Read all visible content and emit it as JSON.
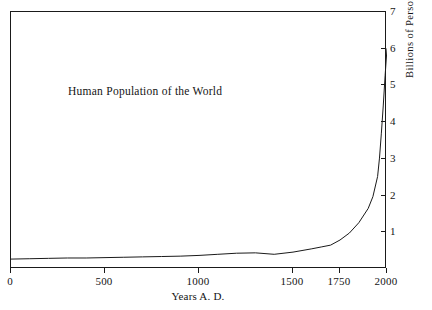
{
  "chart_data": {
    "type": "line",
    "title": "Human Population of the World",
    "xlabel": "Years A. D.",
    "ylabel": "Billions of Persons",
    "xlim": [
      0,
      2000
    ],
    "ylim": [
      0,
      7
    ],
    "grid": false,
    "legend": "none",
    "x_ticks": [
      {
        "value": 0,
        "label": "0"
      },
      {
        "value": 500,
        "label": "500"
      },
      {
        "value": 1000,
        "label": "1000"
      },
      {
        "value": 1500,
        "label": "1500"
      },
      {
        "value": 1750,
        "label": "1750"
      },
      {
        "value": 2000,
        "label": "2000"
      }
    ],
    "y_ticks": [
      {
        "value": 1,
        "label": "1"
      },
      {
        "value": 2,
        "label": "2"
      },
      {
        "value": 3,
        "label": "3"
      },
      {
        "value": 4,
        "label": "4"
      },
      {
        "value": 5,
        "label": "5"
      },
      {
        "value": 6,
        "label": "6"
      },
      {
        "value": 7,
        "label": "7"
      }
    ],
    "series": [
      {
        "name": "World population",
        "color": "#1a1a1a",
        "x": [
          0,
          100,
          200,
          300,
          400,
          500,
          600,
          700,
          800,
          900,
          1000,
          1100,
          1200,
          1300,
          1400,
          1500,
          1600,
          1650,
          1700,
          1750,
          1800,
          1850,
          1900,
          1925,
          1950,
          1960,
          1970,
          1980,
          1990,
          2000
        ],
        "y": [
          0.27,
          0.28,
          0.29,
          0.3,
          0.3,
          0.31,
          0.32,
          0.33,
          0.34,
          0.35,
          0.37,
          0.4,
          0.43,
          0.44,
          0.4,
          0.46,
          0.55,
          0.6,
          0.65,
          0.79,
          0.98,
          1.26,
          1.65,
          1.97,
          2.52,
          3.02,
          3.7,
          4.44,
          5.27,
          6.0
        ]
      }
    ]
  },
  "title_text": "Human Population of the World",
  "axis": {
    "x_title": "Years A. D.",
    "y_title": "Billions of Persons"
  }
}
